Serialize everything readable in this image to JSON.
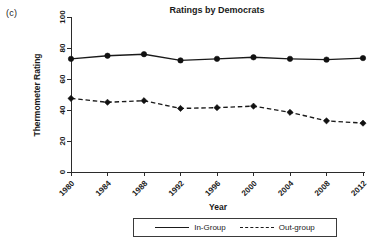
{
  "panel": {
    "label": "(c)"
  },
  "chart_data": {
    "type": "line",
    "title": "Ratings by Democrats",
    "xlabel": "Year",
    "ylabel": "Thermometer Rating",
    "x": [
      1980,
      1984,
      1988,
      1992,
      1996,
      2000,
      2004,
      2008,
      2012
    ],
    "xtick_labels": [
      "1980",
      "1984",
      "1988",
      "1992",
      "1996",
      "2000",
      "2004",
      "2008",
      "2012"
    ],
    "ytick_labels": [
      "0",
      "20",
      "40",
      "60",
      "80",
      "100"
    ],
    "yticks": [
      0,
      20,
      40,
      60,
      80,
      100
    ],
    "ylim": [
      0,
      100
    ],
    "xlim": [
      1980,
      2012
    ],
    "grid": false,
    "legend_position": "bottom-center",
    "series": [
      {
        "name": "In-Group",
        "style": "solid",
        "color": "#1a1a1a",
        "marker": "circle",
        "values": [
          73,
          75,
          76,
          72,
          73,
          74,
          73,
          72.5,
          73.5
        ]
      },
      {
        "name": "Out-group",
        "style": "dashed",
        "color": "#1a1a1a",
        "marker": "diamond",
        "values": [
          47.5,
          45,
          46,
          41,
          41.5,
          42.5,
          38.5,
          33,
          31.5
        ]
      }
    ]
  },
  "legend": {
    "entries": [
      {
        "label": "In-Group"
      },
      {
        "label": "Out-group"
      }
    ]
  }
}
